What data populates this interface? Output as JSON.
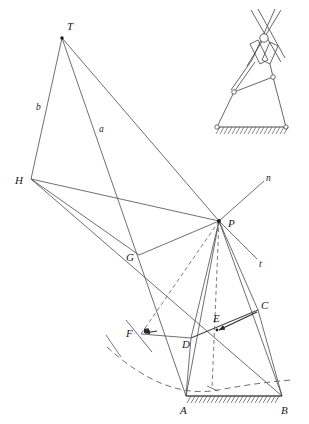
{
  "figure": {
    "stroke_color": "#4a4a52",
    "dashed_color": "#5a5a60",
    "label_color": "#1a1a1a",
    "background": "#ffffff",
    "line_width": 0.8
  },
  "labels": {
    "T": "T",
    "H": "H",
    "P": "P",
    "G": "G",
    "F": "F",
    "D": "D",
    "E": "E",
    "C": "C",
    "A": "A",
    "B": "B",
    "a": "a",
    "b": "b",
    "n": "n",
    "t": "t"
  },
  "points": {
    "T": {
      "x": 62,
      "y": 38,
      "label": "T",
      "lx": 66,
      "ly": 29
    },
    "H": {
      "x": 31,
      "y": 179,
      "label": "H",
      "lx": 19,
      "ly": 183
    },
    "P": {
      "x": 219,
      "y": 221,
      "label": "P",
      "lx": 229,
      "ly": 225
    },
    "G": {
      "x": 139,
      "y": 255,
      "label": "G",
      "lx": 128,
      "ly": 259
    },
    "F": {
      "x": 141,
      "y": 334,
      "label": "F",
      "lx": 128,
      "ly": 333
    },
    "D": {
      "x": 191,
      "y": 338,
      "label": "D",
      "lx": 183,
      "ly": 344
    },
    "E": {
      "x": 216,
      "y": 328,
      "label": "E",
      "lx": 214,
      "ly": 319
    },
    "C": {
      "x": 258,
      "y": 310,
      "label": "C",
      "lx": 261,
      "ly": 306
    },
    "A": {
      "x": 186,
      "y": 396,
      "label": "A",
      "lx": 181,
      "ly": 411
    },
    "B": {
      "x": 282,
      "y": 396,
      "label": "B",
      "lx": 282,
      "ly": 411
    },
    "n": {
      "x": 265,
      "y": 180,
      "label": "n",
      "lx": 266,
      "ly": 182
    },
    "t": {
      "x": 259,
      "y": 261,
      "label": "t",
      "lx": 260,
      "ly": 265
    },
    "a": {
      "x": 102,
      "y": 128,
      "label": "a",
      "lx": 99,
      "ly": 130
    },
    "b": {
      "x": 40,
      "y": 106,
      "label": "b",
      "lx": 38,
      "ly": 108
    }
  },
  "segments": [
    {
      "name": "T-H",
      "from": "T",
      "to": "H",
      "style": "solid"
    },
    {
      "name": "T-P",
      "from": "T",
      "to": "P",
      "style": "solid"
    },
    {
      "name": "T-G-extended",
      "from": "T",
      "to": "A",
      "style": "solid"
    },
    {
      "name": "H-P",
      "from": "H",
      "to": "P",
      "style": "solid"
    },
    {
      "name": "H-G",
      "from": "H",
      "to": "G",
      "style": "solid"
    },
    {
      "name": "H-F-extended",
      "from": "H",
      "to": "B",
      "style": "solid"
    },
    {
      "name": "P-G",
      "from": "P",
      "to": "G",
      "style": "solid"
    },
    {
      "name": "P-F",
      "from": "P",
      "to": "F",
      "style": "dashed"
    },
    {
      "name": "P-D",
      "from": "P",
      "to": "D",
      "style": "solid"
    },
    {
      "name": "P-E",
      "from": "P",
      "to": "E",
      "style": "dashed"
    },
    {
      "name": "P-A",
      "from": "P",
      "to": "A",
      "style": "solid"
    },
    {
      "name": "P-B",
      "from": "P",
      "to": "B",
      "style": "solid"
    },
    {
      "name": "P-C",
      "from": "P",
      "to": "C",
      "style": "solid"
    },
    {
      "name": "P-n",
      "from": "P",
      "to": "n",
      "style": "solid"
    },
    {
      "name": "P-t",
      "from": "P",
      "to": "t",
      "style": "solid"
    },
    {
      "name": "A-B-ground",
      "from": "A",
      "to": "B",
      "style": "solid"
    },
    {
      "name": "A-D",
      "from": "A",
      "to": "D",
      "style": "solid"
    },
    {
      "name": "B-C",
      "from": "B",
      "to": "C",
      "style": "solid"
    },
    {
      "name": "D-C",
      "from": "D",
      "to": "C",
      "style": "solid"
    },
    {
      "name": "F-D",
      "from": "F",
      "to": "D",
      "style": "solid"
    },
    {
      "name": "C-E-arrow",
      "from": "C",
      "to": "E",
      "style": "arrow"
    }
  ],
  "arc": {
    "name": "coupler-curve",
    "style": "dashed",
    "description": "dashed circular arc through lower region"
  },
  "hatching": {
    "ground_main": {
      "x1": 190,
      "x2": 280,
      "y": 396,
      "count": 26
    },
    "ground_inset": {
      "x1": 216,
      "x2": 287,
      "y": 128,
      "count": 21
    }
  },
  "inset": {
    "name": "mechanism-inset",
    "description": "scissor linkage on hatched ground",
    "pivot_circle": {
      "cx": 264,
      "cy": 38,
      "r": 4.2
    },
    "ground_pin_left": {
      "cx": 217,
      "cy": 127,
      "r": 2.2
    },
    "ground_pin_right": {
      "cx": 286,
      "cy": 127,
      "r": 2.2
    },
    "joint_left": {
      "cx": 234,
      "cy": 92,
      "r": 2.2
    },
    "joint_right": {
      "cx": 273,
      "cy": 77,
      "r": 2.2
    }
  }
}
